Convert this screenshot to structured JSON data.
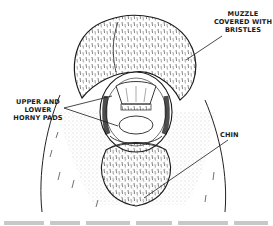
{
  "figure": {
    "labels": {
      "muzzle": [
        "MUZZLE",
        "COVERED WITH",
        "BRISTLES"
      ],
      "pads": [
        "UPPER AND",
        "LOWER",
        "HORNY PADS"
      ],
      "chin": [
        "CHIN"
      ]
    },
    "colors": {
      "ink": "#1a1a1a",
      "background": "#ffffff",
      "stipple": "#555555"
    }
  }
}
